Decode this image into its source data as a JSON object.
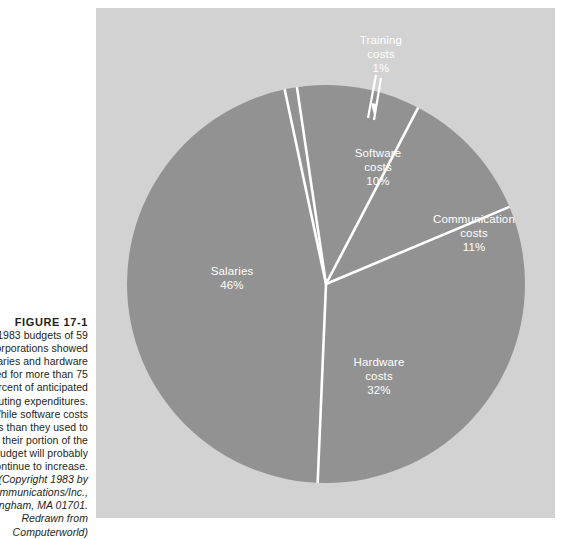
{
  "figure": {
    "title": "FIGURE 17-1",
    "caption_lines": [
      "The 1983 budgets of 59",
      "corporations showed",
      "salaries and hardware",
      "accounted for more than 75",
      "percent of anticipated",
      "computing expenditures.",
      "While software costs",
      "are less than they used to",
      "be, their portion of the",
      "budget will probably",
      "continue to increase."
    ],
    "source_lines": [
      "(Copyright 1983 by",
      "CW Communications/Inc.,",
      "Framingham, MA 01701.",
      "Redrawn from",
      "Computerworld)"
    ]
  },
  "colors": {
    "panel_background": "#d2d2d2",
    "pie_fill": "#929292",
    "slice_divider": "#ffffff",
    "label_text": "#ffffff",
    "caption_text": "#231f20",
    "page_background": "#ffffff"
  },
  "chart_data": {
    "type": "pie",
    "title": "",
    "legend_position": "none",
    "unit": "percent",
    "categories": [
      "Training costs",
      "Software costs",
      "Communication costs",
      "Hardware costs",
      "Salaries"
    ],
    "values": [
      1,
      10,
      11,
      32,
      46
    ],
    "slices": [
      {
        "name": "Training costs",
        "label": "Training",
        "label_line2": "costs",
        "value": 1,
        "percent_label": "1%",
        "start_angle_deg": 348.0,
        "end_angle_deg": 351.6,
        "has_leader_line": true,
        "has_arrow": true
      },
      {
        "name": "Software costs",
        "label": "Software",
        "label_line2": "costs",
        "value": 10,
        "percent_label": "10%",
        "start_angle_deg": 351.6,
        "end_angle_deg": 27.6,
        "has_leader_line": false,
        "has_arrow": false
      },
      {
        "name": "Communication costs",
        "label": "Communication",
        "label_line2": "costs",
        "value": 11,
        "percent_label": "11%",
        "start_angle_deg": 27.6,
        "end_angle_deg": 67.2,
        "has_leader_line": false,
        "has_arrow": false
      },
      {
        "name": "Hardware costs",
        "label": "Hardware",
        "label_line2": "costs",
        "value": 32,
        "percent_label": "32%",
        "start_angle_deg": 67.2,
        "end_angle_deg": 182.4,
        "has_leader_line": false,
        "has_arrow": false
      },
      {
        "name": "Salaries",
        "label": "Salaries",
        "label_line2": "",
        "value": 46,
        "percent_label": "46%",
        "start_angle_deg": 182.4,
        "end_angle_deg": 348.0,
        "has_leader_line": false,
        "has_arrow": false
      }
    ]
  }
}
